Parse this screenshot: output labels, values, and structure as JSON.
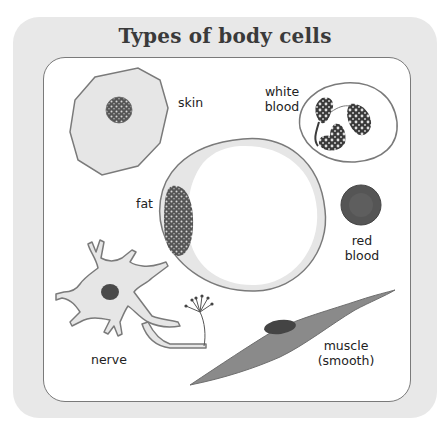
{
  "title": "Types of body cells",
  "colors": {
    "outer_panel": "#e8e8e8",
    "inner_panel": "#ffffff",
    "cell_fill": "#e6e6e6",
    "cell_outline": "#7a7a7a",
    "nucleus": "#4a4a4a",
    "red_blood": "#555555",
    "muscle": "#8a8a8a"
  },
  "cells": [
    {
      "id": "skin",
      "label": "skin"
    },
    {
      "id": "white-blood",
      "label_line1": "white",
      "label_line2": "blood"
    },
    {
      "id": "fat",
      "label": "fat"
    },
    {
      "id": "red-blood",
      "label_line1": "red",
      "label_line2": "blood"
    },
    {
      "id": "nerve",
      "label": "nerve"
    },
    {
      "id": "muscle",
      "label_line1": "muscle",
      "label_line2": "(smooth)"
    }
  ]
}
